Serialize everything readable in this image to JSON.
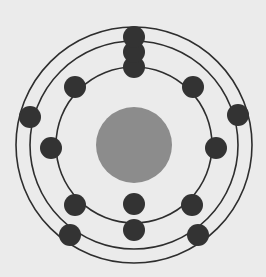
{
  "figure": {
    "width": 266,
    "height": 277,
    "background_color": "#ebebeb"
  },
  "chart_data": {
    "type": "scatter",
    "subtitle": "",
    "xlabel": "",
    "ylabel": "",
    "grid": false,
    "legend_position": "none",
    "xlim": [
      0,
      266
    ],
    "ylim": [
      0,
      277
    ],
    "center": {
      "x": 134,
      "y": 145
    },
    "nucleus": {
      "label": "nucleus",
      "cx": 134,
      "cy": 145,
      "r": 38,
      "fill": "#8c8c8c"
    },
    "shell_colors": {
      "orbit_stroke": "#2e2e2e",
      "electron_fill": "#333333"
    },
    "orbit_stroke_width": 1.6,
    "electron_radius": 11,
    "categories": [
      "Shell 1 (K)",
      "Shell 2 (L)",
      "Shell 3 (M)"
    ],
    "values": [
      2,
      8,
      5
    ],
    "series": [
      {
        "name": "Shell 1 (K)",
        "radius": 78,
        "electron_count": 2,
        "electrons": [
          {
            "label": "e-1-1",
            "cx": 134,
            "cy": 67
          },
          {
            "label": "e-1-2",
            "cx": 134,
            "cy": 204
          }
        ]
      },
      {
        "name": "Shell 2 (L)",
        "radius": 104,
        "electron_count": 8,
        "electrons": [
          {
            "label": "e-2-1",
            "cx": 134,
            "cy": 52
          },
          {
            "label": "e-2-2",
            "cx": 193,
            "cy": 87
          },
          {
            "label": "e-2-3",
            "cx": 216,
            "cy": 148
          },
          {
            "label": "e-2-4",
            "cx": 192,
            "cy": 205
          },
          {
            "label": "e-2-5",
            "cx": 134,
            "cy": 230
          },
          {
            "label": "e-2-6",
            "cx": 75,
            "cy": 205
          },
          {
            "label": "e-2-7",
            "cx": 51,
            "cy": 148
          },
          {
            "label": "e-2-8",
            "cx": 75,
            "cy": 87
          }
        ]
      },
      {
        "name": "Shell 3 (M)",
        "radius": 118,
        "electron_count": 5,
        "electrons": [
          {
            "label": "e-3-1",
            "cx": 134,
            "cy": 37
          },
          {
            "label": "e-3-2",
            "cx": 238,
            "cy": 115
          },
          {
            "label": "e-3-3",
            "cx": 198,
            "cy": 235
          },
          {
            "label": "e-3-4",
            "cx": 70,
            "cy": 235
          },
          {
            "label": "e-3-5",
            "cx": 30,
            "cy": 117
          }
        ]
      }
    ],
    "total_electrons": 15
  }
}
